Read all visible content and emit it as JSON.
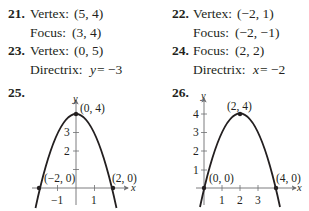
{
  "problems": [
    {
      "number": "21.",
      "lines": [
        {
          "label": "Vertex:",
          "value": "(5, 4)"
        },
        {
          "label": "Focus:",
          "value": "(3, 4)"
        }
      ]
    },
    {
      "number": "22.",
      "lines": [
        {
          "label": "Vertex:",
          "value": "(−2, 1)"
        },
        {
          "label": "Focus:",
          "value": "(−2, −1)"
        }
      ]
    },
    {
      "number": "23.",
      "lines": [
        {
          "label": "Vertex:",
          "value": "(0, 5)"
        },
        {
          "label": "Directrix:",
          "var": "y",
          "value": " = −3"
        }
      ]
    },
    {
      "number": "24.",
      "lines": [
        {
          "label": "Focus:",
          "value": "(2, 2)"
        },
        {
          "label": "Directrix:",
          "var": "x",
          "value": " = −2"
        }
      ]
    }
  ],
  "graphs": [
    {
      "number": "25.",
      "x_axis_label": "x",
      "y_axis_label": "y",
      "x_ticks": [
        "−1",
        "1"
      ],
      "y_ticks": [
        "1",
        "2",
        "3"
      ],
      "points": [
        {
          "label": "(0, 4)",
          "x": 0,
          "y": 4
        },
        {
          "label": "(−2, 0)",
          "x": -2,
          "y": 0
        },
        {
          "label": "(2, 0)",
          "x": 2,
          "y": 0
        }
      ]
    },
    {
      "number": "26.",
      "x_axis_label": "x",
      "y_axis_label": "y",
      "x_ticks": [
        "1",
        "2",
        "3"
      ],
      "y_ticks": [
        "1",
        "2",
        "3",
        "4"
      ],
      "points": [
        {
          "label": "(2, 4)",
          "x": 2,
          "y": 4
        },
        {
          "label": "(0, 0)",
          "x": 0,
          "y": 0
        },
        {
          "label": "(4, 0)",
          "x": 4,
          "y": 0
        }
      ]
    }
  ]
}
